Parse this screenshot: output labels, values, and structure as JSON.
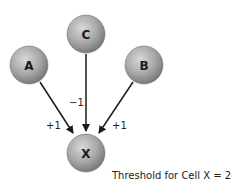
{
  "diagram": {
    "nodes": [
      {
        "id": "A",
        "label": "A",
        "cx": 29,
        "cy": 65
      },
      {
        "id": "C",
        "label": "C",
        "cx": 86,
        "cy": 34
      },
      {
        "id": "B",
        "label": "B",
        "cx": 144,
        "cy": 65
      },
      {
        "id": "X",
        "label": "X",
        "cx": 86,
        "cy": 153
      }
    ],
    "edges": [
      {
        "from": "A",
        "to": "X",
        "weight": "+1"
      },
      {
        "from": "C",
        "to": "X",
        "weight": "−1"
      },
      {
        "from": "B",
        "to": "X",
        "weight": "+1"
      }
    ],
    "caption": "Threshold for Cell X = 2",
    "colors": {
      "node_fill": "#9a9a9a",
      "edge": "#1a1a1a"
    }
  }
}
